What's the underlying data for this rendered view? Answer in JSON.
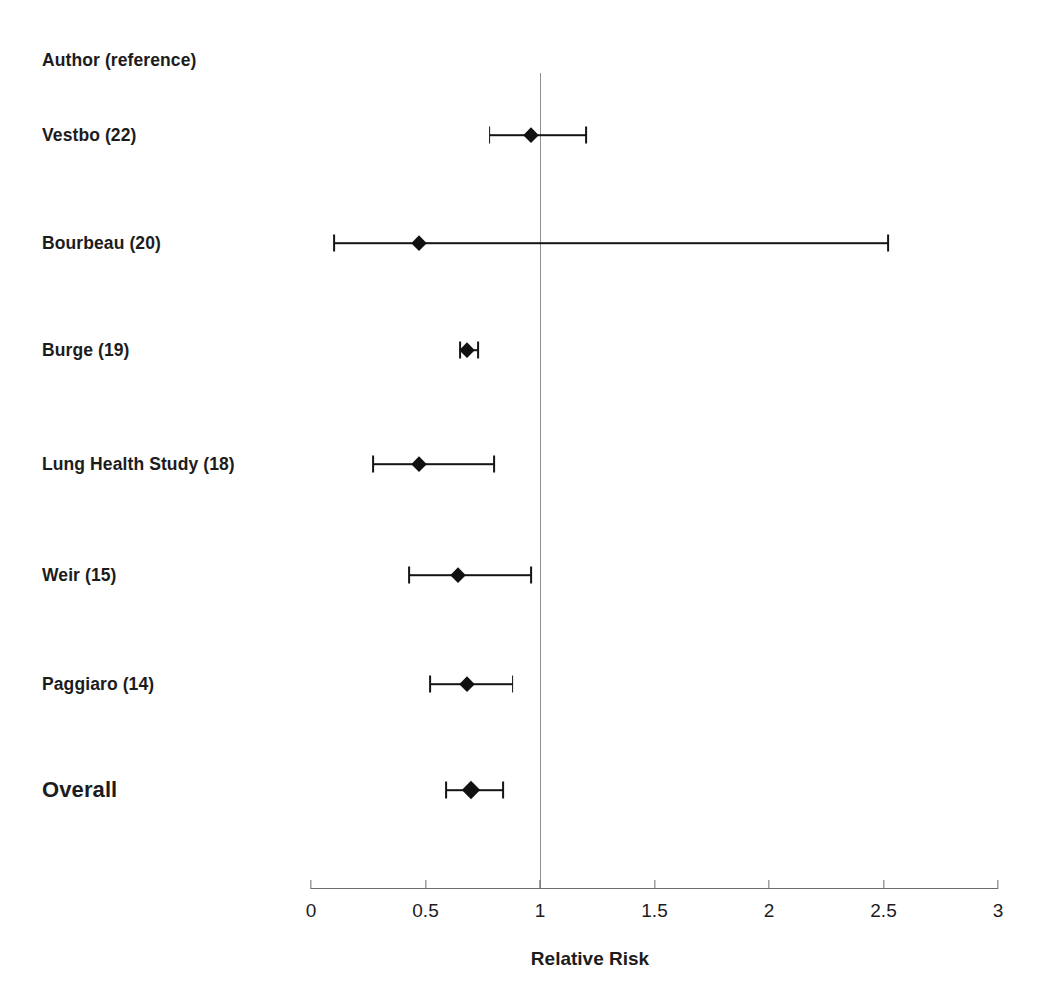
{
  "chart_data": {
    "type": "scatter",
    "plot_kind": "forest-plot",
    "title": "",
    "xlabel": "Relative Risk",
    "ylabel": "",
    "column_header": "Author (reference)",
    "xlim": [
      0,
      3
    ],
    "xticks": [
      0,
      0.5,
      1,
      1.5,
      2,
      2.5,
      3
    ],
    "xtick_labels": [
      "0",
      "0.5",
      "1",
      "1.5",
      "2",
      "2.5",
      "3"
    ],
    "null_value": 1,
    "grid": false,
    "legend": "none",
    "marker": "filled-diamond",
    "marker_color": "#111111",
    "line_color": "#151515",
    "null_line_color": "#8f8f8f",
    "axis_color": "#6d6d6d",
    "categories": [
      "Vestbo (22)",
      "Bourbeau (20)",
      "Burge (19)",
      "Lung Health Study (18)",
      "Weir (15)",
      "Paggiaro (14)",
      "Overall"
    ],
    "values": [
      0.96,
      0.47,
      0.68,
      0.47,
      0.64,
      0.68,
      0.7
    ],
    "ci_low": [
      0.78,
      0.1,
      0.65,
      0.27,
      0.43,
      0.52,
      0.59
    ],
    "ci_high": [
      1.2,
      2.52,
      0.73,
      0.8,
      0.96,
      0.88,
      0.84
    ],
    "rows": [
      {
        "label": "Vestbo (22)",
        "rr": 0.96,
        "ci_low": 0.78,
        "ci_high": 1.2,
        "summary": false,
        "y": 135,
        "marker_size": 15
      },
      {
        "label": "Bourbeau (20)",
        "rr": 0.47,
        "ci_low": 0.1,
        "ci_high": 2.52,
        "summary": false,
        "y": 243,
        "marker_size": 15
      },
      {
        "label": "Burge (19)",
        "rr": 0.68,
        "ci_low": 0.65,
        "ci_high": 0.73,
        "summary": false,
        "y": 350,
        "marker_size": 15
      },
      {
        "label": "Lung Health Study (18)",
        "rr": 0.47,
        "ci_low": 0.27,
        "ci_high": 0.8,
        "summary": false,
        "y": 464,
        "marker_size": 15
      },
      {
        "label": "Weir (15)",
        "rr": 0.64,
        "ci_low": 0.43,
        "ci_high": 0.96,
        "summary": false,
        "y": 575,
        "marker_size": 15
      },
      {
        "label": "Paggiaro (14)",
        "rr": 0.68,
        "ci_low": 0.52,
        "ci_high": 0.88,
        "summary": false,
        "y": 684,
        "marker_size": 15
      },
      {
        "label": "Overall",
        "rr": 0.7,
        "ci_low": 0.59,
        "ci_high": 0.84,
        "summary": true,
        "y": 790,
        "marker_size": 18
      }
    ],
    "header_y": 60,
    "geometry": {
      "x_at_zero": 311,
      "px_per_unit": 229,
      "axis_y": 888,
      "null_line_top": 73,
      "tick_label_y": 900,
      "axis_title_x": 590,
      "axis_title_y": 948
    }
  }
}
